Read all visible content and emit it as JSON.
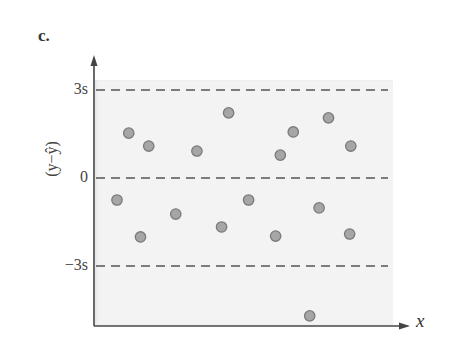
{
  "panel": {
    "label": "c."
  },
  "axes": {
    "ylabel": "(y−ŷ)",
    "xlabel": "x",
    "yticks": [
      {
        "label": "3s",
        "value": 3
      },
      {
        "label": "0",
        "value": 0
      },
      {
        "label": "−3s",
        "value": -3
      }
    ]
  },
  "colors": {
    "plot_background": "#f3f3f3",
    "axis": "#444444",
    "dashed_lines": "#555555",
    "marker_fill": "#a6a6a6",
    "marker_edge": "#7a7a7a"
  },
  "chart_data": {
    "type": "scatter",
    "title": "c.",
    "xlabel": "x",
    "ylabel": "(y − ŷ)",
    "yunit": "s (standard deviations)",
    "ylim": [
      -4.9,
      4.2
    ],
    "reference_lines": [
      {
        "y": 3,
        "label": "3s",
        "style": "dashed"
      },
      {
        "y": 0,
        "label": "0",
        "style": "dashed"
      },
      {
        "y": -3,
        "label": "−3s",
        "style": "dashed"
      }
    ],
    "grid": false,
    "legend": null,
    "x": [
      1.0,
      1.5,
      2.0,
      2.35,
      3.5,
      4.4,
      5.45,
      5.75,
      6.6,
      7.75,
      7.95,
      8.5,
      9.6,
      9.2,
      10.0,
      10.9,
      10.95
    ],
    "y": [
      -0.75,
      1.53,
      -2.01,
      1.09,
      -1.23,
      0.92,
      -1.67,
      2.22,
      -0.75,
      -1.98,
      0.78,
      1.57,
      -1.02,
      -4.7,
      2.05,
      -1.91,
      1.09
    ]
  }
}
